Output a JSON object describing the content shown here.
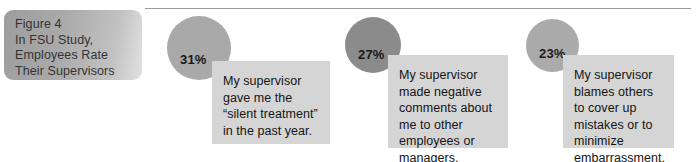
{
  "figure": {
    "title_lines": [
      "Figure 4",
      "In FSU Study,",
      "Employees Rate",
      "Their Supervisors"
    ]
  },
  "chart_data": {
    "type": "bar",
    "title": "Figure 4 In FSU Study, Employees Rate Their Supervisors",
    "xlabel": "",
    "ylabel": "",
    "categories": [
      "My supervisor gave me the “silent treatment” in the past year.",
      "My supervisor made negative comments about me to other employees or managers.",
      "My supervisor blames others to cover up mistakes or to minimize embarrassment."
    ],
    "values": [
      31,
      27,
      23
    ],
    "value_labels": [
      "31%",
      "27%",
      "23%"
    ],
    "units": "percent",
    "ylim": [
      0,
      100
    ],
    "grid": false,
    "legend": false,
    "series": [
      {
        "name": "Percent of employees agreeing",
        "values": [
          31,
          27,
          23
        ]
      }
    ]
  },
  "items": [
    {
      "percent_label": "31%",
      "statement": "My supervisor gave me the “silent treatment” in the past year.",
      "circle_color": "#a9a9a9",
      "box_color": "#d5d5d5"
    },
    {
      "percent_label": "27%",
      "statement": "My supervisor made negative comments about me to other employees or managers.",
      "circle_color": "#8b8b8b",
      "box_color": "#d5d5d5"
    },
    {
      "percent_label": "23%",
      "statement": "My supervisor blames others to cover up mistakes or to minimize embarrassment.",
      "circle_color": "#ababab",
      "box_color": "#d5d5d5"
    }
  ]
}
